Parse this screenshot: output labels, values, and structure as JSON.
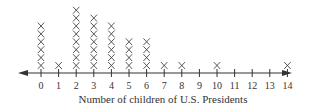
{
  "chart_data": {
    "type": "dot-plot",
    "title": "",
    "xlabel": "Number of children of U.S. Presidents",
    "ylabel": "",
    "marker": "X",
    "categories": [
      0,
      1,
      2,
      3,
      4,
      5,
      6,
      7,
      8,
      9,
      10,
      11,
      12,
      13,
      14
    ],
    "values": [
      6,
      1,
      8,
      7,
      6,
      4,
      4,
      1,
      1,
      0,
      1,
      0,
      0,
      0,
      1
    ],
    "xlim": [
      0,
      14
    ],
    "grid": false,
    "legend": null
  },
  "colors": {
    "axis": "#333333",
    "marker": "#444444"
  }
}
